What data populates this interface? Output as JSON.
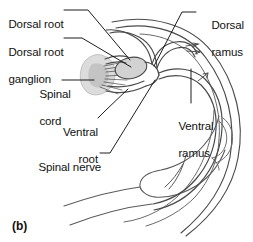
{
  "figure": {
    "letter": "(b)",
    "colors": {
      "ink": "#3a3a3a",
      "ink_dark": "#222222",
      "text": "#111111",
      "spinal_cord_fill": "#d8d8d8",
      "ganglion_fill": "#cfcfcf",
      "background": "#ffffff"
    }
  },
  "labels": [
    {
      "id": "dorsal-root",
      "text": "Dorsal root",
      "line2": "",
      "x": -4,
      "y": 4,
      "align": "left"
    },
    {
      "id": "dorsal-root-ganglion",
      "text": "Dorsal root",
      "line2": "ganglion",
      "x": -4,
      "y": 32,
      "align": "left"
    },
    {
      "id": "spinal-cord",
      "text": "Spinal",
      "line2": "cord",
      "x": 27,
      "y": 74,
      "align": "left"
    },
    {
      "id": "ventral-root",
      "text": "Ventral",
      "line2": "root",
      "x": 44,
      "y": 112,
      "align": "left"
    },
    {
      "id": "spinal-nerve",
      "text": "Spinal nerve",
      "line2": "",
      "x": 26,
      "y": 147,
      "align": "left"
    },
    {
      "id": "dorsal-ramus",
      "text": "Dorsal",
      "line2": "ramus",
      "x": 199,
      "y": 5,
      "align": "left"
    },
    {
      "id": "ventral-ramus",
      "text": "Ventral",
      "line2": "ramus",
      "x": 166,
      "y": 106,
      "align": "left"
    }
  ]
}
